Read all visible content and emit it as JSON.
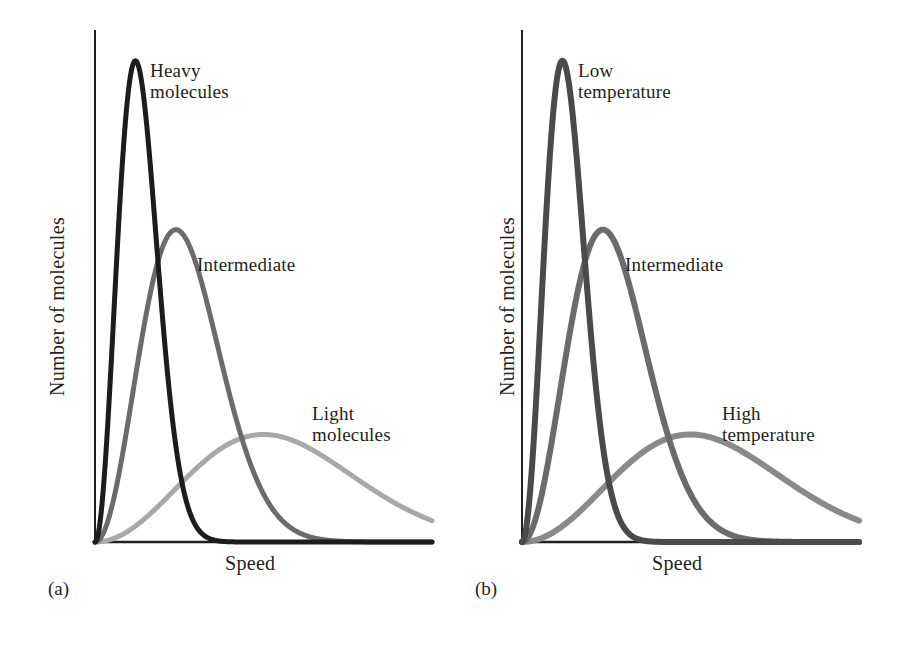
{
  "chart_data": [
    {
      "type": "line",
      "panel_id": "a",
      "caption": "(a)",
      "title": "",
      "xlabel": "Speed",
      "ylabel": "Number of molecules",
      "grid": false,
      "legend_position": "inline-annotations",
      "xlim": [
        0,
        1
      ],
      "ylim": [
        0,
        1
      ],
      "axis_ticks": "none",
      "series": [
        {
          "name": "Heavy molecules",
          "color": "#1c1c1c",
          "stroke_width": 5,
          "peak_x": 0.12,
          "peak_y": 0.94,
          "spread": 0.07,
          "label": "Heavy molecules",
          "label_lines": [
            "Heavy",
            "molecules"
          ],
          "label_x": 150,
          "label_y": 62
        },
        {
          "name": "Intermediate",
          "color": "#6b6b6b",
          "stroke_width": 5,
          "peak_x": 0.24,
          "peak_y": 0.61,
          "spread": 0.13,
          "label": "Intermediate",
          "label_lines": [
            "Intermediate"
          ],
          "label_x": 197,
          "label_y": 256
        },
        {
          "name": "Light molecules",
          "color": "#a8a8a8",
          "stroke_width": 5,
          "peak_x": 0.5,
          "peak_y": 0.21,
          "spread": 0.27,
          "label": "Light molecules",
          "label_lines": [
            "Light",
            "molecules"
          ],
          "label_x": 312,
          "label_y": 405
        }
      ]
    },
    {
      "type": "line",
      "panel_id": "b",
      "caption": "(b)",
      "title": "",
      "xlabel": "Speed",
      "ylabel": "Number of molecules",
      "grid": false,
      "legend_position": "inline-annotations",
      "xlim": [
        0,
        1
      ],
      "ylim": [
        0,
        1
      ],
      "axis_ticks": "none",
      "series": [
        {
          "name": "Low temperature",
          "color": "#4a4a4a",
          "stroke_width": 6,
          "peak_x": 0.12,
          "peak_y": 0.94,
          "spread": 0.075,
          "label": "Low temperature",
          "label_lines": [
            "Low",
            "temperature"
          ],
          "label_x": 578,
          "label_y": 62
        },
        {
          "name": "Intermediate",
          "color": "#6b6b6b",
          "stroke_width": 6,
          "peak_x": 0.24,
          "peak_y": 0.61,
          "spread": 0.13,
          "label": "Intermediate",
          "label_lines": [
            "Intermediate"
          ],
          "label_x": 625,
          "label_y": 256
        },
        {
          "name": "High temperature",
          "color": "#8a8a8a",
          "stroke_width": 6,
          "peak_x": 0.5,
          "peak_y": 0.21,
          "spread": 0.28,
          "label": "High temperature",
          "label_lines": [
            "High",
            "temperature"
          ],
          "label_x": 722,
          "label_y": 405
        }
      ]
    }
  ],
  "panel_a": {
    "caption": "(a)",
    "xlabel": "Speed",
    "ylabel": "Number of molecules",
    "labels": {
      "heavy_line1": "Heavy",
      "heavy_line2": "molecules",
      "intermediate": "Intermediate",
      "light_line1": "Light",
      "light_line2": "molecules"
    }
  },
  "panel_b": {
    "caption": "(b)",
    "xlabel": "Speed",
    "ylabel": "Number of molecules",
    "labels": {
      "low_line1": "Low",
      "low_line2": "temperature",
      "intermediate": "Intermediate",
      "high_line1": "High",
      "high_line2": "temperature"
    }
  },
  "colors": {
    "axis": "#231f20",
    "text": "#231f20",
    "background": "#ffffff",
    "curve_dark": "#1c1c1c",
    "curve_mid": "#6b6b6b",
    "curve_light": "#a8a8a8",
    "curve_dark_b": "#4a4a4a",
    "curve_light_b": "#8a8a8a"
  }
}
